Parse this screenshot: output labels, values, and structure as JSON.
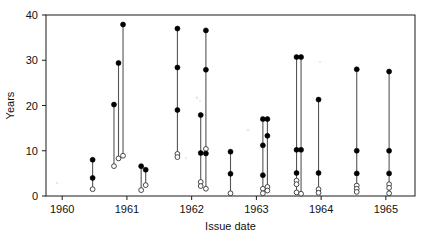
{
  "chart_data": {
    "type": "scatter",
    "title": "",
    "xlabel": "Issue date",
    "ylabel": "Years",
    "xlim": [
      1959.75,
      1965.45
    ],
    "ylim": [
      0,
      40
    ],
    "xticks": [
      1960,
      1961,
      1962,
      1963,
      1964,
      1965
    ],
    "xticklabels": [
      "1960",
      "1961",
      "1962",
      "1963",
      "1964",
      "1965"
    ],
    "yticks": [
      0,
      10,
      20,
      30,
      40
    ],
    "yticklabels": [
      "0",
      "10",
      "20",
      "30",
      "40"
    ],
    "grid": false,
    "legend": null,
    "marker_legend": [
      {
        "name": "filled-circle",
        "meaning": "closed marker",
        "color": "#000000"
      },
      {
        "name": "open-circle",
        "meaning": "open marker",
        "color": "#ffffff"
      }
    ],
    "series": [
      {
        "name": "vertical-range-segments",
        "description": "Each issue date has a vertical line joining an upper filled marker to a lower open marker, with intermediate filled markers.",
        "points": [
          {
            "x": 1960.47,
            "top": 8.0,
            "bottom": 1.5,
            "filled": [
              8.0,
              4.0
            ],
            "open": [
              1.5
            ]
          },
          {
            "x": 1960.8,
            "top": 20.2,
            "bottom": 6.6,
            "filled": [
              20.2
            ],
            "open": [
              6.6
            ]
          },
          {
            "x": 1960.87,
            "top": 29.4,
            "bottom": 8.3,
            "filled": [
              29.4
            ],
            "open": [
              8.3
            ]
          },
          {
            "x": 1960.94,
            "top": 37.9,
            "bottom": 8.9,
            "filled": [
              37.9
            ],
            "open": [
              8.9
            ]
          },
          {
            "x": 1961.22,
            "top": 6.6,
            "bottom": 1.3,
            "filled": [
              6.6
            ],
            "open": [
              1.3
            ]
          },
          {
            "x": 1961.29,
            "top": 5.8,
            "bottom": 2.4,
            "filled": [
              5.8
            ],
            "open": [
              2.4
            ]
          },
          {
            "x": 1961.78,
            "top": 37.0,
            "bottom": 8.6,
            "filled": [
              37.0,
              28.4,
              19.0
            ],
            "open": [
              9.3,
              8.6
            ]
          },
          {
            "x": 1962.14,
            "top": 17.9,
            "bottom": 2.2,
            "filled": [
              17.9,
              9.5
            ],
            "open": [
              3.1,
              2.2
            ]
          },
          {
            "x": 1962.22,
            "top": 36.6,
            "bottom": 1.6,
            "filled": [
              36.6,
              27.9,
              9.4
            ],
            "open": [
              10.4,
              1.6
            ]
          },
          {
            "x": 1962.6,
            "top": 9.8,
            "bottom": 0.6,
            "filled": [
              9.8,
              4.9
            ],
            "open": [
              0.6
            ]
          },
          {
            "x": 1963.1,
            "top": 17.0,
            "bottom": 0.6,
            "filled": [
              17.0,
              11.2,
              4.6
            ],
            "open": [
              1.6,
              0.6
            ]
          },
          {
            "x": 1963.17,
            "top": 17.0,
            "bottom": 1.2,
            "filled": [
              17.0,
              13.3
            ],
            "open": [
              2.0,
              1.2
            ]
          },
          {
            "x": 1963.62,
            "top": 30.7,
            "bottom": 0.8,
            "filled": [
              30.7,
              10.2,
              5.1
            ],
            "open": [
              3.4,
              2.6,
              0.8
            ]
          },
          {
            "x": 1963.69,
            "top": 30.7,
            "bottom": 0.5,
            "filled": [
              30.7,
              10.2
            ],
            "open": [
              0.5
            ]
          },
          {
            "x": 1963.96,
            "top": 21.3,
            "bottom": 0.7,
            "filled": [
              21.3,
              5.1
            ],
            "open": [
              1.5,
              0.7
            ]
          },
          {
            "x": 1964.55,
            "top": 28.0,
            "bottom": 0.9,
            "filled": [
              28.0,
              10.0,
              5.0
            ],
            "open": [
              2.3,
              1.6,
              0.9
            ]
          },
          {
            "x": 1965.05,
            "top": 27.5,
            "bottom": 0.6,
            "filled": [
              27.5,
              10.0,
              5.0
            ],
            "open": [
              2.6,
              1.8,
              0.6
            ]
          }
        ]
      }
    ]
  },
  "axes": {
    "y_title": "Years",
    "x_title": "Issue date"
  }
}
